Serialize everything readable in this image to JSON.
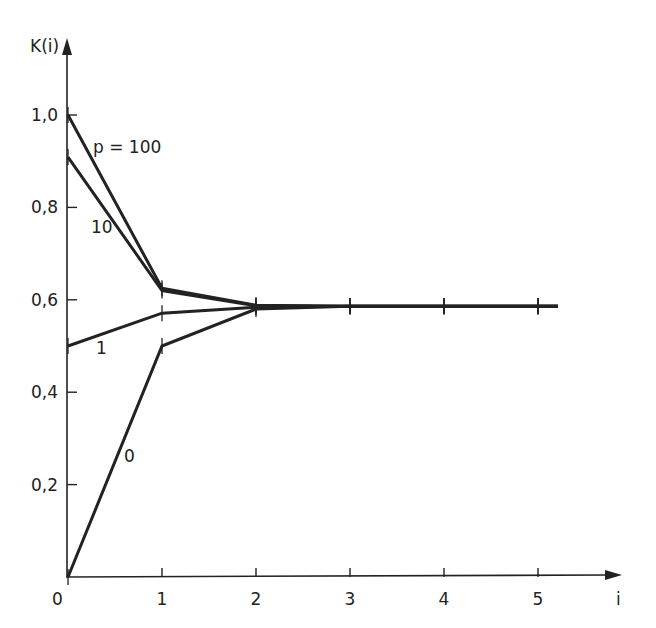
{
  "chart_data": {
    "type": "line",
    "title": "",
    "xlabel": "i",
    "ylabel": "K(i)",
    "x": [
      0,
      1,
      2,
      3,
      4,
      5
    ],
    "x_ticks": [
      "0",
      "1",
      "2",
      "3",
      "4",
      "5"
    ],
    "y_ticks": [
      "0,2",
      "0,4",
      "0,6",
      "0,8",
      "1,0"
    ],
    "origin_label": "0",
    "xlim": [
      0,
      5.3
    ],
    "ylim": [
      0,
      1.15
    ],
    "grid": false,
    "legend": "inline labels on curves",
    "series": [
      {
        "name": "p = 100",
        "label": "p = 100",
        "values": [
          1.0,
          0.625,
          0.588,
          0.586,
          0.586,
          0.586
        ]
      },
      {
        "name": "10",
        "label": "10",
        "values": [
          0.909,
          0.62,
          0.587,
          0.586,
          0.586,
          0.586
        ]
      },
      {
        "name": "1",
        "label": "1",
        "values": [
          0.5,
          0.571,
          0.584,
          0.586,
          0.586,
          0.586
        ]
      },
      {
        "name": "0",
        "label": "0",
        "values": [
          0.0,
          0.5,
          0.58,
          0.586,
          0.586,
          0.586
        ]
      }
    ],
    "limit_value": 0.586,
    "line_color": "#222222"
  }
}
